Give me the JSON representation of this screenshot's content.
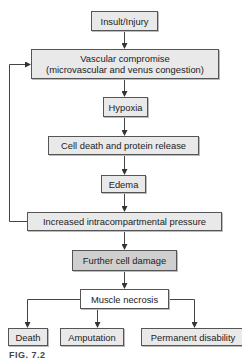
{
  "diagram": {
    "type": "flowchart",
    "nodes": {
      "insult": "Insult/Injury",
      "vascular_line1": "Vascular compromise",
      "vascular_line2": "(microvascular and venus congestion)",
      "hypoxia": "Hypoxia",
      "cell_death": "Cell death and protein release",
      "edema": "Edema",
      "pressure": "Increased intracompartmental pressure",
      "further_damage": "Further cell damage",
      "necrosis": "Muscle necrosis",
      "death": "Death",
      "amputation": "Amputation",
      "disability": "Permanent disability"
    },
    "edges": [
      [
        "Insult/Injury",
        "Vascular compromise"
      ],
      [
        "Vascular compromise",
        "Hypoxia"
      ],
      [
        "Hypoxia",
        "Cell death and protein release"
      ],
      [
        "Cell death and protein release",
        "Edema"
      ],
      [
        "Edema",
        "Increased intracompartmental pressure"
      ],
      [
        "Increased intracompartmental pressure",
        "Vascular compromise"
      ],
      [
        "Increased intracompartmental pressure",
        "Further cell damage"
      ],
      [
        "Further cell damage",
        "Muscle necrosis"
      ],
      [
        "Muscle necrosis",
        "Death"
      ],
      [
        "Muscle necrosis",
        "Amputation"
      ],
      [
        "Muscle necrosis",
        "Permanent disability"
      ]
    ],
    "caption": "FIG. 7.2"
  }
}
